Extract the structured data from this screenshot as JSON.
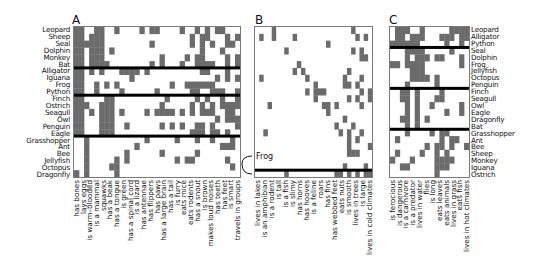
{
  "chart_data": [
    {
      "type": "heatmap",
      "panel": "A",
      "title": "A",
      "rows": [
        "Leopard",
        "Sheep",
        "Seal",
        "Dolphin",
        "Monkey",
        "Bat",
        "Alligator",
        "Iguana",
        "Frog",
        "Python",
        "Finch",
        "Ostrich",
        "Seagull",
        "Owl",
        "Penguin",
        "Eagle",
        "Grasshopper",
        "Ant",
        "Bee",
        "Jellyfish",
        "Octopus",
        "Dragonfly"
      ],
      "row_group_breaks_after": [
        "Bat",
        "Python",
        "Eagle"
      ],
      "columns": [
        "has bones",
        "lays eggs",
        "is warm-blooded",
        "is a mammal",
        "squawks",
        "has a beak",
        "has a tongue",
        "is green",
        "has a spinal cord",
        "is a lizard",
        "has antennae",
        "has flippers",
        "has paws",
        "has a large brain",
        "has a tail",
        "is furry",
        "eats mice",
        "eats rodents",
        "has a snout",
        "is brown",
        "makes loud noises",
        "has teeth",
        "has feet",
        "is smart",
        "travels in groups"
      ],
      "colors": {
        "present": "#6b6b6b",
        "absent": "#ffffff",
        "separator": "#000000"
      }
    },
    {
      "type": "heatmap",
      "panel": "B",
      "title": "B",
      "columns": [
        "lives in lakes",
        "is an amphibian",
        "is a rodent",
        "is tall",
        "is a fish",
        "is slimy",
        "has horns",
        "has hooves",
        "is a feline",
        "roars",
        "has fins",
        "has webbed feet",
        "eats nuts",
        "is smooth",
        "lives in trees",
        "is large",
        "lives in cold climates"
      ],
      "annotation": "Frog",
      "colors": {
        "present": "#6b6b6b",
        "absent": "#ffffff",
        "separator": "#000000"
      }
    },
    {
      "type": "heatmap",
      "panel": "C",
      "title": "C",
      "rows": [
        "Leopard",
        "Alligator",
        "Python",
        "Seal",
        "Dolphin",
        "Frog",
        "Jellyfish",
        "Octopus",
        "Penguin",
        "Finch",
        "Seagull",
        "Owl",
        "Eagle",
        "Dragonfly",
        "Bat",
        "Grasshopper",
        "Ant",
        "Bee",
        "Sheep",
        "Monkey",
        "Iguana",
        "Ostrich"
      ],
      "row_group_breaks_after": [
        "Python",
        "Penguin",
        "Bat"
      ],
      "columns": [
        "is ferocious",
        "is dangerous",
        "is a carnivore",
        "is a predator",
        "lives in water",
        "flies",
        "is long",
        "eats leaves",
        "eats animals",
        "lives in grass",
        "eats fish",
        "lives in hot climates"
      ],
      "colors": {
        "present": "#6b6b6b",
        "absent": "#ffffff",
        "separator": "#000000"
      }
    }
  ],
  "panels": {
    "A": {
      "letter": "A",
      "rows": [
        "Leopard",
        "Sheep",
        "Seal",
        "Dolphin",
        "Monkey",
        "Bat",
        "Alligator",
        "Iguana",
        "Frog",
        "Python",
        "Finch",
        "Ostrich",
        "Seagull",
        "Owl",
        "Penguin",
        "Eagle",
        "Grasshopper",
        "Ant",
        "Bee",
        "Jellyfish",
        "Octopus",
        "Dragonfly"
      ],
      "columns": [
        "has bones",
        "lays eggs",
        "is warm–blooded",
        "is a mammal",
        "squawks",
        "has a beak",
        "has a tongue",
        "is green",
        "has a spinal cord",
        "is a lizard",
        "has antennae",
        "has flippers",
        "has paws",
        "has a large brain",
        "has a tail",
        "is furry",
        "eats mice",
        "eats rodents",
        "has a snout",
        "is brown",
        "makes loud noises",
        "has teeth",
        "has feet",
        "is smart",
        "travels in groups"
      ]
    },
    "B": {
      "letter": "B",
      "columns": [
        "lives in lakes",
        "is an amphibian",
        "is a rodent",
        "is tall",
        "is a fish",
        "is slimy",
        "has horns",
        "has hooves",
        "is a feline",
        "roars",
        "has fins",
        "has webbed feet",
        "eats nuts",
        "is smooth",
        "lives in trees",
        "is large",
        "lives in cold climates"
      ],
      "frog_label": "Frog"
    },
    "C": {
      "letter": "C",
      "rows": [
        "Leopard",
        "Alligator",
        "Python",
        "Seal",
        "Dolphin",
        "Frog",
        "Jellyfish",
        "Octopus",
        "Penguin",
        "Finch",
        "Seagull",
        "Owl",
        "Eagle",
        "Dragonfly",
        "Bat",
        "Grasshopper",
        "Ant",
        "Bee",
        "Sheep",
        "Monkey",
        "Iguana",
        "Ostrich"
      ],
      "columns": [
        "is ferocious",
        "is dangerous",
        "is a carnivore",
        "is a predator",
        "lives in water",
        "flies",
        "is long",
        "eats leaves",
        "eats animals",
        "lives in grass",
        "eats fish",
        "lives in hot climates"
      ]
    }
  }
}
